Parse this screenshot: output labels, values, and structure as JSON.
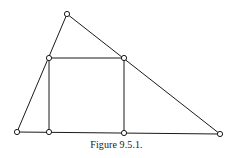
{
  "figure": {
    "caption": "Figure 9.5.1.",
    "colors": {
      "line": "#1a1a1a",
      "vertex_fill": "#ffffff",
      "background": "#ffffff"
    },
    "vertices": [
      {
        "id": "apex",
        "x": 67,
        "y": 14
      },
      {
        "id": "base-left",
        "x": 17,
        "y": 132
      },
      {
        "id": "base-right",
        "x": 220,
        "y": 134
      },
      {
        "id": "square-top-left",
        "x": 49,
        "y": 58
      },
      {
        "id": "square-top-right",
        "x": 124,
        "y": 58
      },
      {
        "id": "square-bottom-left",
        "x": 49,
        "y": 132
      },
      {
        "id": "square-bottom-right",
        "x": 124,
        "y": 133
      }
    ],
    "edges": [
      {
        "from": "base-left",
        "to": "apex",
        "role": "triangle-left-side"
      },
      {
        "from": "apex",
        "to": "base-right",
        "role": "triangle-right-side"
      },
      {
        "from": "base-left",
        "to": "base-right",
        "role": "triangle-base"
      },
      {
        "from": "square-top-left",
        "to": "square-top-right",
        "role": "square-top"
      },
      {
        "from": "square-top-left",
        "to": "square-bottom-left",
        "role": "square-left"
      },
      {
        "from": "square-top-right",
        "to": "square-bottom-right",
        "role": "square-right"
      }
    ],
    "vertex_radius": 2.6
  }
}
